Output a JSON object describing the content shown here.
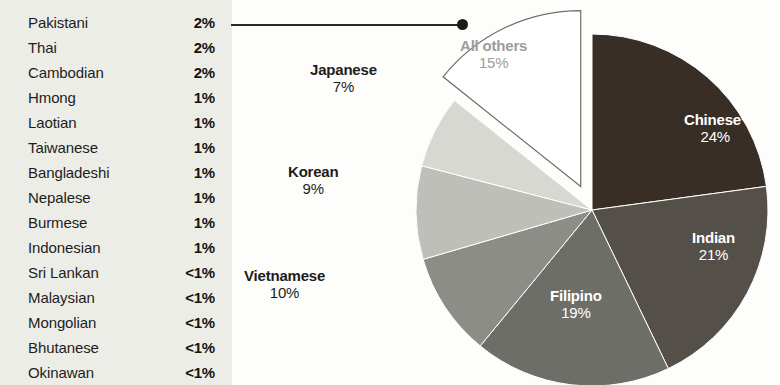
{
  "list": {
    "rows": [
      {
        "label": "Pakistani",
        "value": "2%"
      },
      {
        "label": "Thai",
        "value": "2%"
      },
      {
        "label": "Cambodian",
        "value": "2%"
      },
      {
        "label": "Hmong",
        "value": "1%"
      },
      {
        "label": "Laotian",
        "value": "1%"
      },
      {
        "label": "Taiwanese",
        "value": "1%"
      },
      {
        "label": "Bangladeshi",
        "value": "1%"
      },
      {
        "label": "Nepalese",
        "value": "1%"
      },
      {
        "label": "Burmese",
        "value": "1%"
      },
      {
        "label": "Indonesian",
        "value": "1%"
      },
      {
        "label": "Sri Lankan",
        "value": "<1%"
      },
      {
        "label": "Malaysian",
        "value": "<1%"
      },
      {
        "label": "Mongolian",
        "value": "<1%"
      },
      {
        "label": "Bhutanese",
        "value": "<1%"
      },
      {
        "label": "Okinawan",
        "value": "<1%"
      }
    ]
  },
  "chart_data": {
    "type": "pie",
    "title": "",
    "xlabel": "",
    "ylabel": "",
    "legend_position": "labels-on-slices",
    "grid": false,
    "start_angle_deg": 0,
    "direction": "clockwise",
    "categories": [
      "Chinese*",
      "Indian",
      "Filipino",
      "Vietnamese",
      "Korean",
      "Japanese",
      "All others"
    ],
    "values": [
      24,
      21,
      19,
      10,
      9,
      7,
      15
    ],
    "value_labels": [
      "24%",
      "21%",
      "19%",
      "10%",
      "9%",
      "7%",
      "15%"
    ],
    "slices": [
      {
        "name": "Chinese*",
        "value": 24,
        "label": "24%",
        "color": "#382e26",
        "label_placement": "inside",
        "exploded": false
      },
      {
        "name": "Indian",
        "value": 21,
        "label": "21%",
        "color": "#554f49",
        "label_placement": "inside",
        "exploded": false
      },
      {
        "name": "Filipino",
        "value": 19,
        "label": "19%",
        "color": "#6e6e69",
        "label_placement": "inside",
        "exploded": false
      },
      {
        "name": "Vietnamese",
        "value": 10,
        "label": "10%",
        "color": "#8d8d88",
        "label_placement": "outside",
        "exploded": false
      },
      {
        "name": "Korean",
        "value": 9,
        "label": "9%",
        "color": "#bfbfb9",
        "label_placement": "outside",
        "exploded": false
      },
      {
        "name": "Japanese",
        "value": 7,
        "label": "7%",
        "color": "#d8d8d3",
        "label_placement": "outside",
        "exploded": false
      },
      {
        "name": "All others",
        "value": 15,
        "label": "15%",
        "color": "#ffffff",
        "label_placement": "inside",
        "exploded": true
      }
    ],
    "annotation": {
      "text": "",
      "type": "leader-line",
      "from": "list-panel",
      "to": "All others"
    }
  },
  "colors": {
    "panel_background": "#edede8",
    "page_background": "#fdfdfb",
    "leader_line": "#2a2a26",
    "others_label": "#9d9d98",
    "inside_label": "#ffffff",
    "outside_label": "#1d1d1b"
  }
}
